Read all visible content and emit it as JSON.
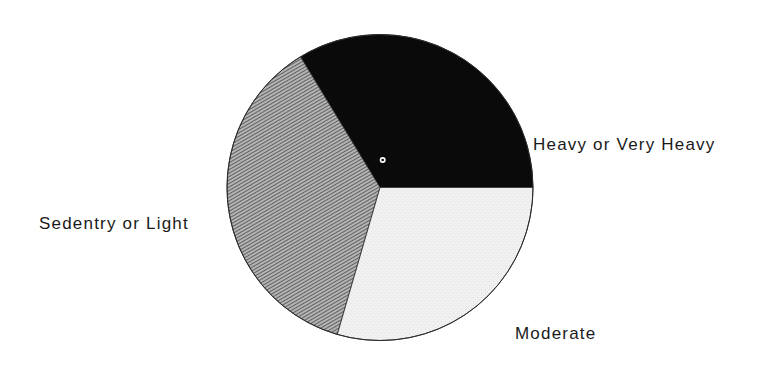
{
  "chart_data": {
    "type": "pie",
    "title": "",
    "start_angle_deg": 0,
    "direction": "counterclockwise",
    "center": [
      380,
      187.5
    ],
    "radius": 153,
    "slices": [
      {
        "label": "Heavy or Very Heavy",
        "value": 33.7,
        "fill": "#0a0a0a",
        "pattern": "solid"
      },
      {
        "label": "Sedentry or Light",
        "value": 36.8,
        "fill": "#8c8c8c",
        "pattern": "diagonal-hatch"
      },
      {
        "label": "Moderate",
        "value": 29.5,
        "fill": "#eeeeee",
        "pattern": "light-stipple"
      }
    ],
    "center_marker": {
      "x": 382.7,
      "y": 160,
      "r": 3
    }
  },
  "labels": {
    "heavy": "Heavy or Very Heavy",
    "sedentary": "Sedentry or Light",
    "moderate": "Moderate"
  }
}
